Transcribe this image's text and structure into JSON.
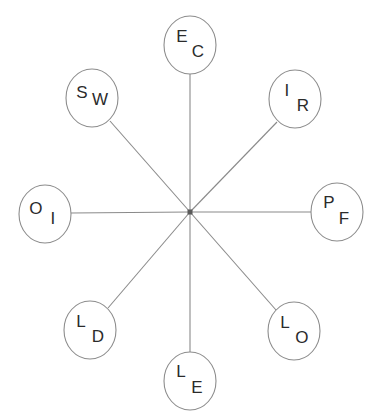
{
  "diagram": {
    "type": "radial-star-diagram",
    "spoke_count": 8,
    "line_color": "#8a8a8a",
    "node_stroke_color": "#8c8c8c",
    "node_fill_color": "#ffffff",
    "text_color": "#2b2b2b",
    "background_color": "#ffffff",
    "center": {
      "x": 190,
      "y": 212
    },
    "node_radius_x": 26,
    "node_radius_y": 29,
    "nodes": [
      {
        "id": "node-ec",
        "position": "top",
        "cx": 190,
        "cy": 45,
        "letter_1": "E",
        "letter_2": "C",
        "letter_1_dx": -8,
        "letter_1_dy": -7,
        "letter_2_dx": 8,
        "letter_2_dy": 8
      },
      {
        "id": "node-ir",
        "position": "top-right",
        "cx": 295,
        "cy": 99,
        "letter_1": "I",
        "letter_2": "R",
        "letter_1_dx": -8,
        "letter_1_dy": -7,
        "letter_2_dx": 8,
        "letter_2_dy": 8
      },
      {
        "id": "node-pf",
        "position": "right",
        "cx": 337,
        "cy": 212,
        "letter_1": "P",
        "letter_2": "F",
        "letter_1_dx": -8,
        "letter_1_dy": -8,
        "letter_2_dx": 7,
        "letter_2_dy": 8
      },
      {
        "id": "node-lo",
        "position": "bottom-right",
        "cx": 294,
        "cy": 331,
        "letter_1": "L",
        "letter_2": "O",
        "letter_1_dx": -9,
        "letter_1_dy": -7,
        "letter_2_dx": 8,
        "letter_2_dy": 8
      },
      {
        "id": "node-le",
        "position": "bottom",
        "cx": 190,
        "cy": 381,
        "letter_1": "L",
        "letter_2": "E",
        "letter_1_dx": -9,
        "letter_1_dy": -8,
        "letter_2_dx": 7,
        "letter_2_dy": 8
      },
      {
        "id": "node-ld",
        "position": "bottom-left",
        "cx": 90,
        "cy": 330,
        "letter_1": "L",
        "letter_2": "D",
        "letter_1_dx": -9,
        "letter_1_dy": -7,
        "letter_2_dx": 8,
        "letter_2_dy": 8
      },
      {
        "id": "node-oi",
        "position": "left",
        "cx": 45,
        "cy": 214,
        "letter_1": "O",
        "letter_2": "I",
        "letter_1_dx": -9,
        "letter_1_dy": -4,
        "letter_2_dx": 8,
        "letter_2_dy": 6
      },
      {
        "id": "node-sw",
        "position": "top-left",
        "cx": 92,
        "cy": 98,
        "letter_1": "S",
        "letter_2": "W",
        "letter_1_dx": -10,
        "letter_1_dy": -4,
        "letter_2_dx": 8,
        "letter_2_dy": 3
      }
    ],
    "spokes": [
      {
        "id": "spoke-ec",
        "x1": 190,
        "y1": 212,
        "x2": 190,
        "y2": 74
      },
      {
        "id": "spoke-ir",
        "x1": 190,
        "y1": 212,
        "x2": 277,
        "y2": 122
      },
      {
        "id": "spoke-pf",
        "x1": 190,
        "y1": 212,
        "x2": 311,
        "y2": 212
      },
      {
        "id": "spoke-lo",
        "x1": 190,
        "y1": 212,
        "x2": 276,
        "y2": 310
      },
      {
        "id": "spoke-le",
        "x1": 190,
        "y1": 212,
        "x2": 190,
        "y2": 352
      },
      {
        "id": "spoke-ld",
        "x1": 190,
        "y1": 212,
        "x2": 108,
        "y2": 308
      },
      {
        "id": "spoke-oi",
        "x1": 190,
        "y1": 212,
        "x2": 71,
        "y2": 213
      },
      {
        "id": "spoke-sw",
        "x1": 190,
        "y1": 212,
        "x2": 110,
        "y2": 121
      }
    ]
  }
}
